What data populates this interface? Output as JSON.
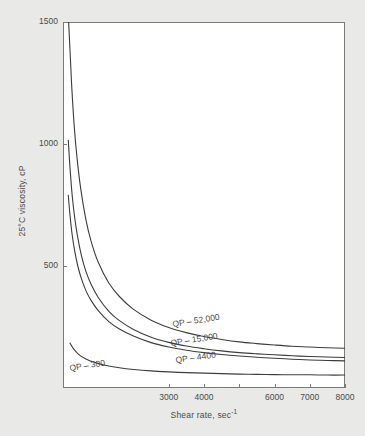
{
  "chart_data": {
    "type": "line",
    "title": "",
    "xlabel": "Shear rate, sec",
    "xlabel_sup": "-1",
    "ylabel": "25°C viscosity, cP",
    "xlim": [
      0,
      8000
    ],
    "ylim": [
      0,
      1500
    ],
    "grid": false,
    "legend": "inline-curve-labels",
    "xticks": [
      3000,
      4000,
      5000,
      6000,
      7000,
      8000
    ],
    "xtick_labels": [
      "3000",
      "4000",
      "",
      "6000",
      "7000",
      "8000"
    ],
    "yticks": [
      500,
      1000,
      1500
    ],
    "ytick_labels": [
      "500",
      "1000",
      "1500"
    ],
    "series": [
      {
        "name": "QP - 52,000",
        "label": "QP – 52,000",
        "x": [
          160,
          200,
          250,
          320,
          400,
          500,
          650,
          800,
          1000,
          1300,
          1600,
          2000,
          2500,
          3000,
          3500,
          4000,
          4500,
          5000,
          5500,
          6000,
          6500,
          7000,
          7500,
          8000
        ],
        "y": [
          1500,
          1380,
          1230,
          1070,
          940,
          820,
          690,
          600,
          515,
          430,
          375,
          322,
          278,
          248,
          227,
          211,
          199,
          189,
          182,
          176,
          171,
          168,
          165,
          163
        ]
      },
      {
        "name": "QP - 15,000",
        "label": "QP – 15,000",
        "x": [
          150,
          200,
          260,
          330,
          420,
          520,
          650,
          800,
          1000,
          1300,
          1600,
          2000,
          2500,
          3000,
          3500,
          4000,
          4500,
          5000,
          5500,
          6000,
          6500,
          7000,
          7500,
          8000
        ],
        "y": [
          1015,
          900,
          790,
          700,
          615,
          545,
          478,
          424,
          371,
          314,
          276,
          240,
          208,
          187,
          172,
          161,
          152,
          145,
          140,
          136,
          132,
          129,
          127,
          125
        ]
      },
      {
        "name": "QP - 4400",
        "label": "QP – 4400",
        "x": [
          150,
          200,
          260,
          330,
          420,
          520,
          650,
          800,
          1000,
          1300,
          1600,
          2000,
          2500,
          3000,
          3500,
          4000,
          4500,
          5000,
          5500,
          6000,
          6500,
          7000,
          7500,
          8000
        ],
        "y": [
          790,
          706,
          628,
          563,
          500,
          449,
          399,
          358,
          317,
          272,
          242,
          213,
          186,
          168,
          155,
          145,
          137,
          131,
          126,
          122,
          118,
          115,
          113,
          111
        ]
      },
      {
        "name": "QP - 300",
        "label": "QP – 300",
        "x": [
          200,
          300,
          450,
          650,
          900,
          1200,
          1600,
          2000,
          2500,
          3000,
          3500,
          4000,
          4500,
          5000,
          5500,
          6000,
          6500,
          7000,
          7500,
          8000
        ],
        "y": [
          184,
          160,
          137,
          119,
          105,
          93,
          83,
          76,
          70,
          66,
          63,
          61,
          59,
          57,
          56,
          55,
          54,
          54,
          53,
          53
        ]
      }
    ],
    "annotations": [
      {
        "text": "QP – 52,000",
        "x_px": 173,
        "y_px": 327,
        "rotation": -9
      },
      {
        "text": "QP – 15,000",
        "x_px": 171,
        "y_px": 346,
        "rotation": -9
      },
      {
        "text": "QP – 4400",
        "x_px": 176,
        "y_px": 363,
        "rotation": -8
      },
      {
        "text": "QP – 300",
        "x_px": 70,
        "y_px": 371,
        "rotation": -9
      }
    ],
    "colors": {
      "line": "#3c3c3c",
      "axis": "#6e6e6e",
      "text": "#4a4a4a",
      "plot_background": "#ffffff",
      "page_background": "#e9e9e7"
    }
  }
}
